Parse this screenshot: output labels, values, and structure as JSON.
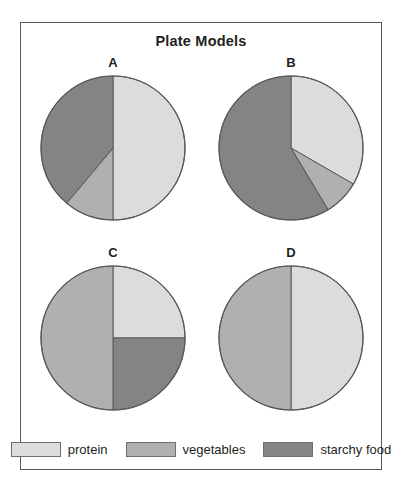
{
  "figure": {
    "title": "Plate Models"
  },
  "colors": {
    "protein": "#dcdcdc",
    "vegetables": "#b0b0b0",
    "starchy_food": "#848484",
    "outline": "#58595b",
    "frame": "#58595b",
    "text": "#231f20",
    "background": "#ffffff"
  },
  "legend": {
    "items": [
      {
        "label": "protein",
        "color_key": "protein",
        "color": "#dcdcdc"
      },
      {
        "label": "vegetables",
        "color_key": "vegetables",
        "color": "#b0b0b0"
      },
      {
        "label": "starchy food",
        "color_key": "starchy_food",
        "color": "#848484"
      }
    ]
  },
  "chart_data": {
    "type": "pie",
    "title": "Plate Models",
    "legend_position": "bottom",
    "categories": [
      "protein",
      "vegetables",
      "starchy food"
    ],
    "category_colors": [
      "#dcdcdc",
      "#b0b0b0",
      "#848484"
    ],
    "units": "percent",
    "note": "Four plate models labelled A, B, C and D. Each pie starts at 12 o'clock and is read clockwise.",
    "charts": [
      {
        "label": "A",
        "start_angle_deg": 0,
        "direction": "clockwise",
        "slices": [
          {
            "category": "protein",
            "value": 50,
            "color": "#dcdcdc",
            "start_deg": 0,
            "end_deg": 180
          },
          {
            "category": "vegetables",
            "value": 11,
            "color": "#b0b0b0",
            "start_deg": 180,
            "end_deg": 220
          },
          {
            "category": "starchy food",
            "value": 39,
            "color": "#848484",
            "start_deg": 220,
            "end_deg": 360
          }
        ]
      },
      {
        "label": "B",
        "start_angle_deg": 0,
        "direction": "clockwise",
        "slices": [
          {
            "category": "protein",
            "value": 33,
            "color": "#dcdcdc",
            "start_deg": 0,
            "end_deg": 120
          },
          {
            "category": "vegetables",
            "value": 8,
            "color": "#b0b0b0",
            "start_deg": 120,
            "end_deg": 149
          },
          {
            "category": "starchy food",
            "value": 59,
            "color": "#848484",
            "start_deg": 149,
            "end_deg": 360
          }
        ]
      },
      {
        "label": "C",
        "start_angle_deg": 0,
        "direction": "clockwise",
        "slices": [
          {
            "category": "protein",
            "value": 25,
            "color": "#dcdcdc",
            "start_deg": 0,
            "end_deg": 90
          },
          {
            "category": "starchy food",
            "value": 25,
            "color": "#848484",
            "start_deg": 90,
            "end_deg": 180
          },
          {
            "category": "vegetables",
            "value": 50,
            "color": "#b0b0b0",
            "start_deg": 180,
            "end_deg": 360
          }
        ]
      },
      {
        "label": "D",
        "start_angle_deg": 0,
        "direction": "clockwise",
        "slices": [
          {
            "category": "protein",
            "value": 50,
            "color": "#dcdcdc",
            "start_deg": 0,
            "end_deg": 180
          },
          {
            "category": "vegetables",
            "value": 50,
            "color": "#b0b0b0",
            "start_deg": 180,
            "end_deg": 360
          }
        ]
      }
    ]
  }
}
